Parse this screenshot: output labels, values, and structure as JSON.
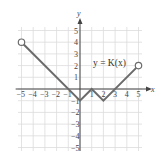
{
  "chart_data": {
    "type": "line",
    "title": "y = K(x)",
    "function_label": "y = K(x)",
    "xlabel": "x",
    "ylabel": "y",
    "xlim": [
      -5,
      5
    ],
    "ylim": [
      -5,
      5
    ],
    "grid": true,
    "x_ticks": [
      "-5",
      "-4",
      "-3",
      "-2",
      "-1",
      "1",
      "2",
      "3",
      "4",
      "5"
    ],
    "y_ticks": [
      "5",
      "4",
      "3",
      "2",
      "1",
      "-1",
      "-2",
      "-3",
      "-4",
      "-5"
    ],
    "series": [
      {
        "name": "K(x)",
        "points": [
          {
            "x": -5,
            "y": 4
          },
          {
            "x": 0,
            "y": -1
          },
          {
            "x": 1,
            "y": 0
          },
          {
            "x": 2,
            "y": -1
          },
          {
            "x": 5,
            "y": 2
          }
        ],
        "open_endpoints": [
          {
            "x": -5,
            "y": 4
          },
          {
            "x": 5,
            "y": 2
          }
        ],
        "color": "#6b6b6b"
      }
    ],
    "colors": {
      "grid": "#dcdcdc",
      "axis": "#444444",
      "curve": "#6b6b6b"
    }
  }
}
